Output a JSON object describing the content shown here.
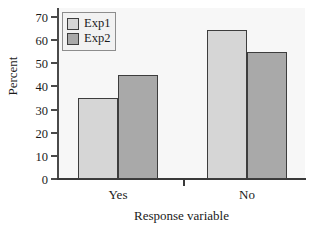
{
  "chart_data": {
    "type": "bar",
    "title": "",
    "xlabel": "Response variable",
    "ylabel": "Percent",
    "categories": [
      "Yes",
      "No"
    ],
    "series": [
      {
        "name": "Exp1",
        "values": [
          35,
          64.5
        ],
        "color": "#d6d6d6"
      },
      {
        "name": "Exp2",
        "values": [
          45,
          55
        ],
        "color": "#a9a9a9"
      }
    ],
    "ylim": [
      0,
      70
    ],
    "ytick_labels": [
      "0",
      "10",
      "20",
      "30",
      "40",
      "50",
      "60",
      "70"
    ],
    "ytick_values": [
      0,
      10,
      20,
      30,
      40,
      50,
      60,
      70
    ],
    "grid": false,
    "legend_position": "top-left",
    "bar_border_color": "#3d3d3d",
    "plot_background": "#f7f7f7",
    "axis_color": "#3a3a3a"
  },
  "legend": {
    "entries": [
      {
        "label": "Exp1"
      },
      {
        "label": "Exp2"
      }
    ]
  }
}
